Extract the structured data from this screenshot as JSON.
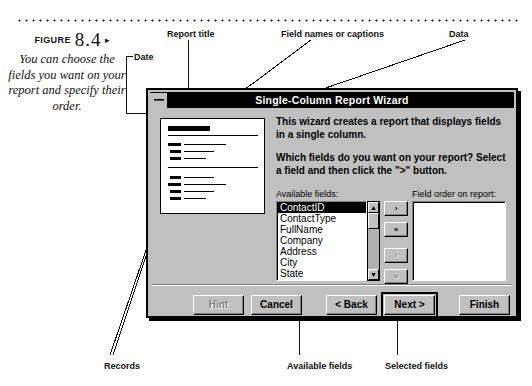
{
  "figure": {
    "label": "FIGURE",
    "number": "8.4",
    "arrow": "▸",
    "caption": "You can choose the fields you want on your report and specify their order."
  },
  "annotations": {
    "report_title": "Report title",
    "date": "Date",
    "field_names": "Field names or captions",
    "data": "Data",
    "records": "Records",
    "available_fields": "Available fields",
    "selected_fields": "Selected fields"
  },
  "dialog": {
    "title": "Single-Column Report Wizard",
    "system_menu": "system-menu-box",
    "paragraphs": [
      "This wizard creates a report that displays fields in a single column.",
      "Which fields do you want on your report?  Select a field and then click the \">\" button."
    ],
    "available_label": "Available fields:",
    "selected_label": "Field order on report:",
    "available_fields": [
      "ContactID",
      "ContactType",
      "FullName",
      "Company",
      "Address",
      "City",
      "State"
    ],
    "selected_field_index": 0,
    "selected_fields": [],
    "move_buttons": [
      {
        "label": "›",
        "name": "move-right-button",
        "enabled": true
      },
      {
        "label": "»",
        "name": "move-all-right-button",
        "enabled": true
      },
      {
        "label": "‹",
        "name": "move-left-button",
        "enabled": false
      },
      {
        "label": "«",
        "name": "move-all-left-button",
        "enabled": false
      }
    ],
    "scrollbar": {
      "up_arrow": "▲",
      "down_arrow": "▼"
    },
    "buttons": [
      {
        "label": "Hint",
        "mnemonic": "H",
        "enabled": false,
        "default": false
      },
      {
        "label": "Cancel",
        "mnemonic": "",
        "enabled": true,
        "default": false
      },
      {
        "label": "< Back",
        "mnemonic": "B",
        "enabled": true,
        "default": false
      },
      {
        "label": "Next >",
        "mnemonic": "N",
        "enabled": true,
        "default": true
      },
      {
        "label": "Finish",
        "mnemonic": "F",
        "enabled": true,
        "default": false
      }
    ]
  },
  "colors": {
    "face": "#c0c0c0",
    "titlebar": "#000000",
    "titlebar_text": "#ffffff",
    "page": "#ffffff",
    "ink": "#111111"
  }
}
